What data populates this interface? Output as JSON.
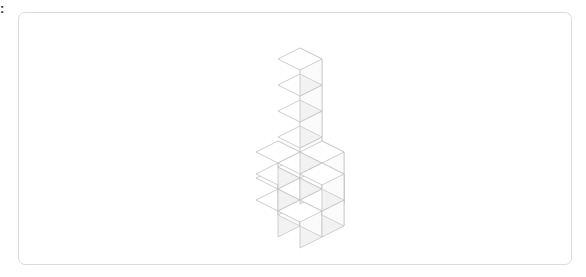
{
  "page": {
    "background_color": "#ffffff",
    "edge_glyph": ":"
  },
  "canvas_panel": {
    "name": "voxel-canvas",
    "background_color": "#ffffff",
    "border_color": "#dcdcdc",
    "border_radius_px": 7,
    "x": 18,
    "y": 12,
    "width": 554,
    "height": 253
  },
  "figure": {
    "type": "isometric-voxel-wireframe",
    "total_cubes": 16,
    "line_color": "#bdbdbd",
    "top_face_color": "#ffffff",
    "front_face_color": "#f2f2f2",
    "side_face_color": "#fbfbfb",
    "projection": {
      "cube_size_px": 26,
      "x_axis_px": [
        22,
        -11
      ],
      "y_axis_px": [
        22,
        11
      ],
      "z_axis_px": [
        0,
        -26
      ],
      "origin_px": [
        277,
        214
      ]
    },
    "voxels": [
      {
        "x": 0,
        "y": 0,
        "z": 0,
        "label": "column-base"
      },
      {
        "x": 0,
        "y": 0,
        "z": 1,
        "label": "column-1"
      },
      {
        "x": 0,
        "y": 0,
        "z": 2,
        "label": "column-2"
      },
      {
        "x": 0,
        "y": 0,
        "z": 3,
        "label": "column-3"
      },
      {
        "x": 0,
        "y": 0,
        "z": 4,
        "label": "column-4"
      },
      {
        "x": 0,
        "y": 0,
        "z": 5,
        "label": "column-5"
      },
      {
        "x": -1,
        "y": 0,
        "z": 1,
        "label": "upper-arm-left"
      },
      {
        "x": 1,
        "y": 0,
        "z": 1,
        "label": "upper-arm-right"
      },
      {
        "x": 0,
        "y": -1,
        "z": 1,
        "label": "upper-arm-back"
      },
      {
        "x": 0,
        "y": 1,
        "z": 1,
        "label": "upper-arm-front"
      },
      {
        "x": -1,
        "y": 0,
        "z": 0,
        "label": "lower-arm-left"
      },
      {
        "x": 1,
        "y": 0,
        "z": 0,
        "label": "lower-arm-right"
      },
      {
        "x": 0,
        "y": -1,
        "z": 0,
        "label": "lower-arm-back"
      },
      {
        "x": 0,
        "y": 1,
        "z": 0,
        "label": "lower-arm-front"
      },
      {
        "x": -1,
        "y": 1,
        "z": 0,
        "label": "lower-corner-left-front"
      },
      {
        "x": 1,
        "y": -1,
        "z": 0,
        "label": "lower-corner-right-back"
      }
    ]
  }
}
